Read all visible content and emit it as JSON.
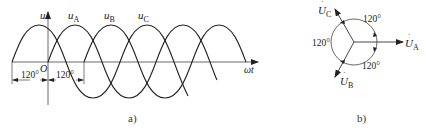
{
  "figure_a": {
    "caption": "a)",
    "axis_y_label": "u",
    "axis_x_label": "ωt",
    "origin_label": "O",
    "curves": [
      {
        "name": "u",
        "sub": "A",
        "phase_deg": 0
      },
      {
        "name": "u",
        "sub": "B",
        "phase_deg": -120
      },
      {
        "name": "u",
        "sub": "C",
        "phase_deg": 120
      }
    ],
    "dim_left": "120°",
    "dim_right": "120°"
  },
  "figure_b": {
    "caption": "b)",
    "phasors": [
      {
        "name": "U",
        "sub": "A",
        "angle_deg": 0
      },
      {
        "name": "U",
        "sub": "B",
        "angle_deg": -120
      },
      {
        "name": "U",
        "sub": "C",
        "angle_deg": 120
      }
    ],
    "angle_top_right": "120°",
    "angle_left": "120°",
    "angle_bottom_right": "120°"
  },
  "colors": {
    "ink": "#222222",
    "background": "#ffffff"
  }
}
